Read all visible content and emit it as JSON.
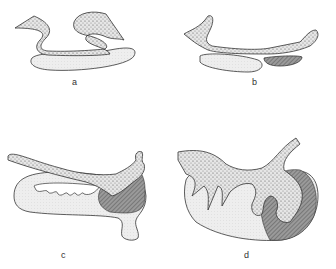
{
  "figure": {
    "panels": [
      {
        "id": "a",
        "label": "a"
      },
      {
        "id": "b",
        "label": "b"
      },
      {
        "id": "c",
        "label": "c"
      },
      {
        "id": "d",
        "label": "d"
      }
    ],
    "colors": {
      "stipple_fill": "#cfcfcf",
      "light_fill": "#e8e8e8",
      "dark_hatch": "#8a8a8a",
      "outline": "#333333"
    }
  }
}
